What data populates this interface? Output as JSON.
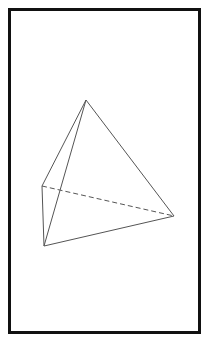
{
  "figure": {
    "type": "tetrahedron-wireframe",
    "frame": {
      "border_color": "#111111",
      "border_width": 3
    },
    "line_color": "#555555",
    "vertices": {
      "apex": [
        86,
        100
      ],
      "back_left": [
        42,
        186
      ],
      "front_left": [
        44,
        246
      ],
      "right": [
        174,
        216
      ]
    },
    "solid_edges": [
      [
        "apex",
        "back_left"
      ],
      [
        "apex",
        "front_left"
      ],
      [
        "apex",
        "right"
      ],
      [
        "back_left",
        "front_left"
      ],
      [
        "front_left",
        "right"
      ]
    ],
    "dashed_edges": [
      [
        "back_left",
        "right"
      ]
    ]
  }
}
